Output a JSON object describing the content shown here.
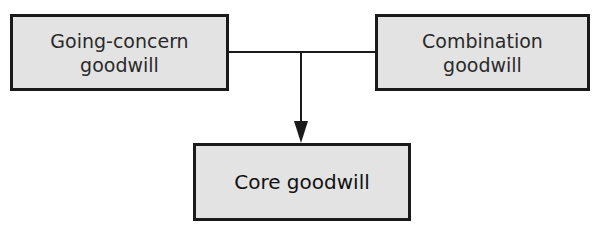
{
  "diagram": {
    "type": "flow",
    "nodes": [
      {
        "id": "going_concern",
        "line1": "Going-concern",
        "line2": "goodwill"
      },
      {
        "id": "combination",
        "line1": "Combination",
        "line2": "goodwill"
      },
      {
        "id": "core",
        "label": "Core goodwill"
      }
    ],
    "edges": [
      {
        "from": "going_concern",
        "to": "core"
      },
      {
        "from": "combination",
        "to": "core"
      }
    ],
    "colors": {
      "box_fill": "#e3e3e3",
      "stroke": "#1a1a1a"
    }
  }
}
